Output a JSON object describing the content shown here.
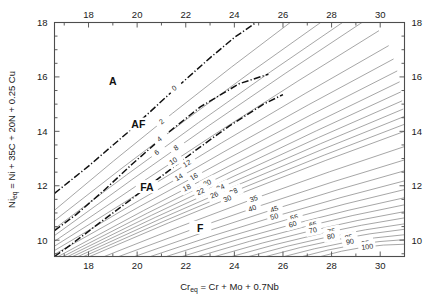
{
  "figure": {
    "name": "wrc-1992-ferrite-number-diagram",
    "caption": ""
  },
  "axes": {
    "x": {
      "title_main": "Cr",
      "title_sub": "eq",
      "title_rest": " = Cr + Mo + 0.7Nb",
      "min": 16.6,
      "max": 31.0,
      "major_ticks": [
        18,
        20,
        22,
        24,
        26,
        28,
        30
      ],
      "minor_ticks": [
        17,
        19,
        21,
        23,
        25,
        27,
        29,
        31
      ],
      "tick_labels": [
        "18",
        "20",
        "22",
        "24",
        "26",
        "28",
        "30"
      ]
    },
    "y": {
      "title_main": "Ni",
      "title_sub": "eq",
      "title_rest": " = Ni + 35C + 20N + 0.25 Cu",
      "min": 9.4,
      "max": 18.0,
      "major_ticks": [
        10,
        12,
        14,
        16,
        18
      ],
      "minor_ticks": [
        9.5,
        10.5,
        11,
        11.5,
        12.5,
        13,
        13.5,
        14.5,
        15,
        15.5,
        16.5,
        17,
        17.5
      ],
      "tick_labels": [
        "10",
        "12",
        "14",
        "16",
        "18"
      ]
    }
  },
  "regions": [
    {
      "label": "A",
      "x": 19.0,
      "y": 15.85
    },
    {
      "label": "AF",
      "x": 20.05,
      "y": 14.25
    },
    {
      "label": "FA",
      "x": 20.4,
      "y": 11.95
    },
    {
      "label": "F",
      "x": 22.6,
      "y": 10.45
    }
  ],
  "boundaries": [
    {
      "name": "austenite-austenite-ferrite",
      "points": [
        [
          16.6,
          11.72
        ],
        [
          18.0,
          12.72
        ],
        [
          19.6,
          13.95
        ],
        [
          21.3,
          15.35
        ],
        [
          23.0,
          16.7
        ],
        [
          24.0,
          17.45
        ],
        [
          24.9,
          18.0
        ]
      ]
    },
    {
      "name": "austenite-ferrite-ferrite-austenite",
      "points": [
        [
          16.6,
          10.35
        ],
        [
          17.5,
          10.95
        ],
        [
          18.6,
          11.8
        ],
        [
          19.8,
          12.8
        ],
        [
          21.2,
          13.9
        ],
        [
          22.6,
          14.9
        ],
        [
          24.2,
          15.75
        ],
        [
          25.4,
          16.1
        ]
      ]
    },
    {
      "name": "ferrite-austenite-ferrite",
      "points": [
        [
          16.6,
          9.4
        ],
        [
          17.3,
          9.85
        ],
        [
          18.4,
          10.6
        ],
        [
          19.6,
          11.4
        ],
        [
          21.0,
          12.35
        ],
        [
          22.4,
          13.3
        ],
        [
          23.8,
          14.2
        ],
        [
          25.2,
          15.0
        ],
        [
          26.0,
          15.35
        ]
      ]
    }
  ],
  "chart_data": {
    "type": "line",
    "title": "",
    "xlabel": "Cr_eq = Cr + Mo + 0.7Nb",
    "ylabel": "Ni_eq = Ni + 35C + 20N + 0.25 Cu",
    "xlim": [
      16.6,
      31.0
    ],
    "ylim": [
      9.4,
      18.0
    ],
    "grid": false,
    "legend": "none",
    "series_name": "Ferrite Number (FN) iso-lines",
    "contour_values": [
      0,
      2,
      4,
      6,
      8,
      10,
      12,
      14,
      16,
      18,
      20,
      22,
      24,
      26,
      28,
      30,
      35,
      40,
      45,
      50,
      55,
      60,
      65,
      70,
      75,
      80,
      85,
      90,
      95,
      100
    ],
    "contours": [
      {
        "fn": 0,
        "start": [
          16.6,
          11.72
        ],
        "end": [
          24.9,
          18.0
        ],
        "label_at": 0.6,
        "is_boundary": true
      },
      {
        "fn": 2,
        "start": [
          16.6,
          11.1
        ],
        "end": [
          26.3,
          18.0
        ],
        "label_at": 0.46
      },
      {
        "fn": 4,
        "start": [
          16.6,
          10.72
        ],
        "end": [
          27.55,
          18.0
        ],
        "label_at": 0.4
      },
      {
        "fn": 6,
        "start": [
          16.6,
          10.42
        ],
        "end": [
          28.45,
          18.0
        ],
        "label_at": 0.36
      },
      {
        "fn": 8,
        "start": [
          16.6,
          10.17
        ],
        "end": [
          29.25,
          18.0
        ],
        "label_at": 0.4
      },
      {
        "fn": 10,
        "start": [
          16.6,
          9.96
        ],
        "end": [
          29.95,
          17.7
        ],
        "label_at": 0.37
      },
      {
        "fn": 12,
        "start": [
          16.6,
          9.78
        ],
        "end": [
          30.35,
          17.15
        ],
        "label_at": 0.4
      },
      {
        "fn": 14,
        "start": [
          16.6,
          9.62
        ],
        "end": [
          30.55,
          16.66
        ],
        "label_at": 0.37
      },
      {
        "fn": 16,
        "start": [
          16.6,
          9.48
        ],
        "end": [
          30.7,
          16.22
        ],
        "label_at": 0.41
      },
      {
        "fn": 18,
        "start": [
          16.75,
          9.4
        ],
        "end": [
          30.8,
          15.82
        ],
        "label_at": 0.38
      },
      {
        "fn": 20,
        "start": [
          16.95,
          9.4
        ],
        "end": [
          30.85,
          15.45
        ],
        "label_at": 0.43
      },
      {
        "fn": 22,
        "start": [
          17.15,
          9.4
        ],
        "end": [
          30.9,
          15.12
        ],
        "label_at": 0.4
      },
      {
        "fn": 24,
        "start": [
          17.35,
          9.4
        ],
        "end": [
          30.95,
          14.82
        ],
        "label_at": 0.45
      },
      {
        "fn": 26,
        "start": [
          17.57,
          9.4
        ],
        "end": [
          31.0,
          14.55
        ],
        "label_at": 0.42
      },
      {
        "fn": 28,
        "start": [
          17.8,
          9.4
        ],
        "end": [
          31.0,
          14.26
        ],
        "label_at": 0.47
      },
      {
        "fn": 30,
        "start": [
          18.05,
          9.4
        ],
        "end": [
          31.0,
          14.0
        ],
        "label_at": 0.44
      },
      {
        "fn": 35,
        "start": [
          18.65,
          9.4
        ],
        "end": [
          31.0,
          13.44
        ],
        "label_at": 0.5
      },
      {
        "fn": 40,
        "start": [
          19.25,
          9.4
        ],
        "end": [
          31.0,
          12.95
        ],
        "label_at": 0.47
      },
      {
        "fn": 45,
        "start": [
          19.9,
          9.4
        ],
        "end": [
          31.0,
          12.55
        ],
        "label_at": 0.52
      },
      {
        "fn": 50,
        "start": [
          20.55,
          9.4
        ],
        "end": [
          31.0,
          12.18
        ],
        "label_at": 0.49
      },
      {
        "fn": 55,
        "start": [
          21.2,
          9.4
        ],
        "end": [
          31.0,
          11.86
        ],
        "label_at": 0.54
      },
      {
        "fn": 60,
        "start": [
          21.85,
          9.4
        ],
        "end": [
          31.0,
          11.56
        ],
        "label_at": 0.5
      },
      {
        "fn": 65,
        "start": [
          22.5,
          9.4
        ],
        "end": [
          31.0,
          11.3
        ],
        "label_at": 0.56
      },
      {
        "fn": 70,
        "start": [
          23.2,
          9.4
        ],
        "end": [
          31.0,
          11.05
        ],
        "label_at": 0.52
      },
      {
        "fn": 75,
        "start": [
          23.9,
          9.4
        ],
        "end": [
          31.0,
          10.82
        ],
        "label_at": 0.58
      },
      {
        "fn": 80,
        "start": [
          24.6,
          9.4
        ],
        "end": [
          31.0,
          10.6
        ],
        "label_at": 0.53
      },
      {
        "fn": 85,
        "start": [
          25.3,
          9.4
        ],
        "end": [
          31.0,
          10.4
        ],
        "label_at": 0.6
      },
      {
        "fn": 90,
        "start": [
          26.05,
          9.4
        ],
        "end": [
          31.0,
          10.2
        ],
        "label_at": 0.55
      },
      {
        "fn": 95,
        "start": [
          26.8,
          9.4
        ],
        "end": [
          31.0,
          10.02
        ],
        "label_at": 0.62
      },
      {
        "fn": 100,
        "start": [
          27.55,
          9.4
        ],
        "end": [
          31.0,
          9.85
        ],
        "label_at": 0.56
      }
    ]
  }
}
